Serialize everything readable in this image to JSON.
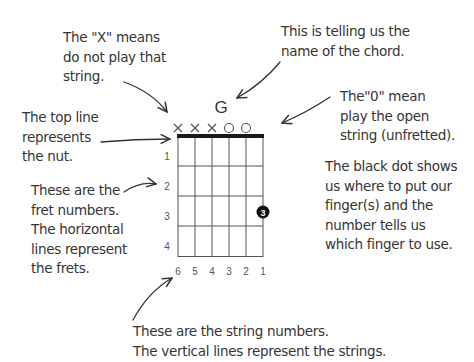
{
  "chord": {
    "name": "G",
    "string_markers": [
      "X",
      "X",
      "X",
      "O",
      "O",
      ""
    ],
    "fret_numbers": [
      "1",
      "2",
      "3",
      "4"
    ],
    "string_numbers": [
      "6",
      "5",
      "4",
      "3",
      "2",
      "1"
    ],
    "finger_dot": {
      "string": 1,
      "fret": 3,
      "finger": "3"
    }
  },
  "annotations": {
    "x_marker": "The \"X\" means\ndo not play that\nstring.",
    "chord_name": "This is telling us the\nname of the chord.",
    "open_marker": "The\"0\" mean\nplay the open\nstring (unfretted).",
    "nut": "The top line\nrepresents\nthe nut.",
    "black_dot": "The black dot shows\nus where to put our\nfinger(s) and the\nnumber tells us\nwhich finger to use.",
    "fret_numbers": "These are the\nfret numbers.\nThe horizontal\nlines represent\nthe frets.",
    "string_numbers": "These are the string numbers.\nThe vertical lines represent the strings."
  },
  "colors": {
    "ink": "#333333",
    "grid": "#444444",
    "nut": "#1a1a1a",
    "dot": "#111111"
  }
}
